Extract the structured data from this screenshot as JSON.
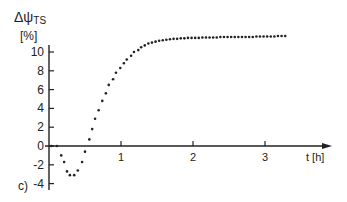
{
  "figure": {
    "panel_label": "c)",
    "y_label_main": "Δψ",
    "y_label_sub": "TS",
    "y_unit": "[%]",
    "x_label": "t [h]"
  },
  "axes": {
    "y_ticks": [
      10,
      8,
      6,
      4,
      2,
      0,
      -2,
      -4
    ],
    "x_ticks": [
      1,
      2,
      3
    ],
    "y_tick_labels": [
      "10",
      "8",
      "6",
      "4",
      "2",
      "0",
      "-2",
      "-4"
    ],
    "x_tick_labels": [
      "1",
      "2",
      "3"
    ]
  },
  "colors": {
    "ink": "#222222",
    "background": "#ffffff"
  },
  "chart_data": {
    "type": "scatter",
    "title": "",
    "panel": "c)",
    "xlabel": "t [h]",
    "ylabel": "ΔψTS [%]",
    "xlim": [
      0,
      3.6
    ],
    "ylim": [
      -4.5,
      12
    ],
    "grid": false,
    "legend": null,
    "x_ticks": [
      1,
      2,
      3
    ],
    "y_ticks": [
      -4,
      -2,
      0,
      2,
      4,
      6,
      8,
      10
    ],
    "series": [
      {
        "name": "ΔψTS",
        "marker": "dot",
        "x": [
          0.03,
          0.11,
          0.17,
          0.21,
          0.25,
          0.29,
          0.35,
          0.4,
          0.46,
          0.5,
          0.56,
          0.6,
          0.64,
          0.69,
          0.74,
          0.79,
          0.83,
          0.89,
          0.93,
          0.99,
          1.04,
          1.08,
          1.14,
          1.18,
          1.24,
          1.28,
          1.33,
          1.38,
          1.43,
          1.48,
          1.53,
          1.58,
          1.63,
          1.68,
          1.73,
          1.78,
          1.83,
          1.88,
          1.93,
          1.98,
          2.03,
          2.08,
          2.13,
          2.18,
          2.23,
          2.28,
          2.33,
          2.38,
          2.43,
          2.48,
          2.53,
          2.58,
          2.63,
          2.68,
          2.73,
          2.78,
          2.83,
          2.88,
          2.93,
          2.98,
          3.03,
          3.08,
          3.13,
          3.18,
          3.23,
          3.28
        ],
        "y": [
          0,
          0,
          -1.0,
          -1.7,
          -2.7,
          -3.1,
          -3.1,
          -2.6,
          -1.7,
          -0.6,
          0.7,
          1.8,
          2.9,
          3.8,
          4.8,
          5.6,
          6.5,
          7.1,
          7.8,
          8.3,
          8.8,
          9.2,
          9.6,
          10.0,
          10.2,
          10.5,
          10.7,
          10.9,
          11.0,
          11.1,
          11.2,
          11.25,
          11.3,
          11.35,
          11.4,
          11.4,
          11.45,
          11.45,
          11.5,
          11.5,
          11.5,
          11.5,
          11.55,
          11.55,
          11.55,
          11.55,
          11.55,
          11.6,
          11.6,
          11.6,
          11.6,
          11.6,
          11.6,
          11.6,
          11.6,
          11.6,
          11.6,
          11.65,
          11.65,
          11.65,
          11.65,
          11.65,
          11.65,
          11.7,
          11.7,
          11.7
        ]
      }
    ]
  }
}
